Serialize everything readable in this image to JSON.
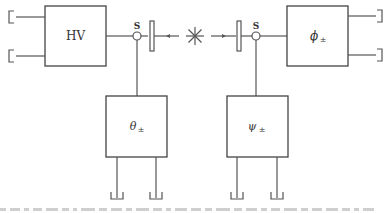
{
  "diagram": {
    "type": "block-diagram",
    "source": {
      "symbol": "✳",
      "name": "entangled-source"
    },
    "left_arm": {
      "splitter_label": "S",
      "upper_box_label": "HV",
      "lower_box_label_main": "θ",
      "lower_box_label_sub": "±"
    },
    "right_arm": {
      "splitter_label": "S",
      "upper_box_label_main": "ϕ",
      "upper_box_label_sub": "±",
      "lower_box_label_main": "ψ",
      "lower_box_label_sub": "±"
    },
    "colors": {
      "line": "#555555",
      "box_border": "#444444",
      "text": "#333333",
      "background": "#ffffff"
    }
  }
}
